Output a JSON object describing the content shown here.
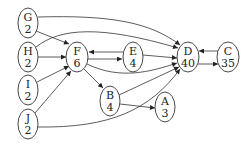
{
  "diagram": {
    "type": "directed-graph",
    "nodes": [
      {
        "id": "G",
        "label": "G",
        "value": "2",
        "cx": 28,
        "cy": 23
      },
      {
        "id": "H",
        "label": "H",
        "value": "2",
        "cx": 28,
        "cy": 57
      },
      {
        "id": "I",
        "label": "I",
        "value": "2",
        "cx": 28,
        "cy": 90
      },
      {
        "id": "J",
        "label": "J",
        "value": "2",
        "cx": 28,
        "cy": 124
      },
      {
        "id": "F",
        "label": "F",
        "value": "6",
        "cx": 77,
        "cy": 57
      },
      {
        "id": "E",
        "label": "E",
        "value": "4",
        "cx": 133,
        "cy": 57
      },
      {
        "id": "D",
        "label": "D",
        "value": "40",
        "cx": 188,
        "cy": 57
      },
      {
        "id": "C",
        "label": "C",
        "value": "35",
        "cx": 228,
        "cy": 57
      },
      {
        "id": "B",
        "label": "B",
        "value": "4",
        "cx": 110,
        "cy": 101
      },
      {
        "id": "A",
        "label": "A",
        "value": "3",
        "cx": 165,
        "cy": 107
      }
    ],
    "edges": [
      {
        "from": "G",
        "to": "F"
      },
      {
        "from": "G",
        "to": "D"
      },
      {
        "from": "H",
        "to": "F"
      },
      {
        "from": "H",
        "to": "D"
      },
      {
        "from": "I",
        "to": "F"
      },
      {
        "from": "J",
        "to": "F"
      },
      {
        "from": "J",
        "to": "D"
      },
      {
        "from": "F",
        "to": "E"
      },
      {
        "from": "E",
        "to": "F"
      },
      {
        "from": "E",
        "to": "D"
      },
      {
        "from": "F",
        "to": "D"
      },
      {
        "from": "F",
        "to": "B"
      },
      {
        "from": "B",
        "to": "D"
      },
      {
        "from": "B",
        "to": "A"
      },
      {
        "from": "D",
        "to": "C"
      },
      {
        "from": "C",
        "to": "D"
      }
    ]
  }
}
